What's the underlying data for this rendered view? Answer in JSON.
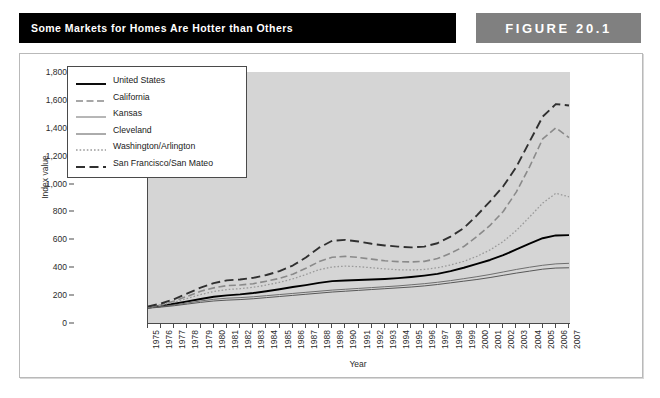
{
  "header": {
    "title": "Some Markets for Homes Are Hotter than Others",
    "figure_tag": "FIGURE 20.1"
  },
  "colors": {
    "title_bar_bg": "#000000",
    "title_bar_text": "#ffffff",
    "figure_tag_bg": "#808080",
    "figure_tag_text": "#ffffff",
    "plot_bg": "#d5d5d5",
    "frame_border": "#b9b9b9",
    "axis": "#4a4a4a",
    "united_states": "#000000",
    "california": "#8a8a8a",
    "kansas": "#6e6e6e",
    "cleveland": "#585858",
    "washington_arlington": "#9a9a9a",
    "san_francisco_san_mateo": "#303030"
  },
  "chart_data": {
    "type": "line",
    "title": "Some Markets for Homes Are Hotter than Others",
    "xlabel": "Year",
    "ylabel": "Index value",
    "ylim": [
      0,
      1800
    ],
    "ytick_step": 200,
    "yticks": [
      0,
      200,
      400,
      600,
      800,
      1000,
      1200,
      1400,
      1600,
      1800
    ],
    "ytick_labels": [
      "0",
      "200",
      "400",
      "600",
      "800",
      "1,000",
      "1,200",
      "1,400",
      "1,600",
      "1,800"
    ],
    "grid": false,
    "legend_position": "upper-left-inside",
    "x": [
      1975,
      1976,
      1977,
      1978,
      1979,
      1980,
      1981,
      1982,
      1983,
      1984,
      1985,
      1986,
      1987,
      1988,
      1989,
      1990,
      1991,
      1992,
      1993,
      1994,
      1995,
      1996,
      1997,
      1998,
      1999,
      2000,
      2001,
      2002,
      2003,
      2004,
      2005,
      2006,
      2007
    ],
    "xtick_labels": [
      "1975",
      "1976",
      "1977",
      "1978",
      "1979",
      "1980",
      "1981",
      "1982",
      "1983",
      "1984",
      "1985",
      "1986",
      "1987",
      "1988",
      "1989",
      "1990",
      "1991",
      "1992",
      "1993",
      "1994",
      "1995",
      "1996",
      "1997",
      "1998",
      "1999",
      "2000",
      "2001",
      "2002",
      "2003",
      "2004",
      "2005",
      "2006",
      "2007"
    ],
    "series": [
      {
        "name": "United States",
        "style": "solid-thick",
        "color": "#000000",
        "values": [
          110,
          122,
          138,
          155,
          172,
          188,
          198,
          205,
          215,
          228,
          242,
          258,
          272,
          288,
          300,
          305,
          308,
          312,
          316,
          322,
          330,
          340,
          352,
          372,
          396,
          424,
          452,
          486,
          528,
          570,
          608,
          628,
          630
        ]
      },
      {
        "name": "California",
        "style": "dashed",
        "color": "#8a8a8a",
        "values": [
          112,
          130,
          158,
          192,
          228,
          252,
          268,
          272,
          282,
          300,
          320,
          350,
          392,
          440,
          472,
          478,
          470,
          458,
          446,
          440,
          438,
          442,
          462,
          500,
          548,
          620,
          700,
          800,
          940,
          1120,
          1320,
          1400,
          1330
        ]
      },
      {
        "name": "Kansas",
        "style": "solid-thin",
        "color": "#6e6e6e",
        "values": [
          108,
          118,
          130,
          144,
          158,
          170,
          178,
          182,
          188,
          196,
          204,
          212,
          220,
          228,
          236,
          242,
          248,
          254,
          260,
          266,
          274,
          282,
          292,
          304,
          318,
          332,
          348,
          366,
          384,
          400,
          414,
          424,
          428
        ]
      },
      {
        "name": "Cleveland",
        "style": "solid-thin",
        "color": "#585858",
        "values": [
          106,
          114,
          124,
          136,
          148,
          158,
          164,
          168,
          174,
          182,
          190,
          198,
          206,
          214,
          222,
          228,
          234,
          240,
          246,
          252,
          258,
          266,
          276,
          288,
          300,
          312,
          326,
          342,
          358,
          372,
          386,
          394,
          396
        ]
      },
      {
        "name": "Washington/Arlington",
        "style": "dotted",
        "color": "#9a9a9a",
        "values": [
          112,
          128,
          150,
          176,
          204,
          226,
          240,
          246,
          256,
          272,
          292,
          316,
          348,
          382,
          402,
          408,
          404,
          396,
          388,
          382,
          380,
          384,
          396,
          416,
          442,
          478,
          524,
          584,
          664,
          760,
          860,
          930,
          905
        ]
      },
      {
        "name": "San Francisco/San Mateo",
        "style": "long-dash",
        "color": "#303030",
        "values": [
          118,
          140,
          172,
          212,
          254,
          286,
          306,
          312,
          324,
          344,
          372,
          412,
          470,
          540,
          590,
          596,
          584,
          568,
          556,
          548,
          542,
          548,
          572,
          620,
          680,
          772,
          872,
          980,
          1120,
          1300,
          1480,
          1570,
          1560
        ]
      }
    ]
  }
}
